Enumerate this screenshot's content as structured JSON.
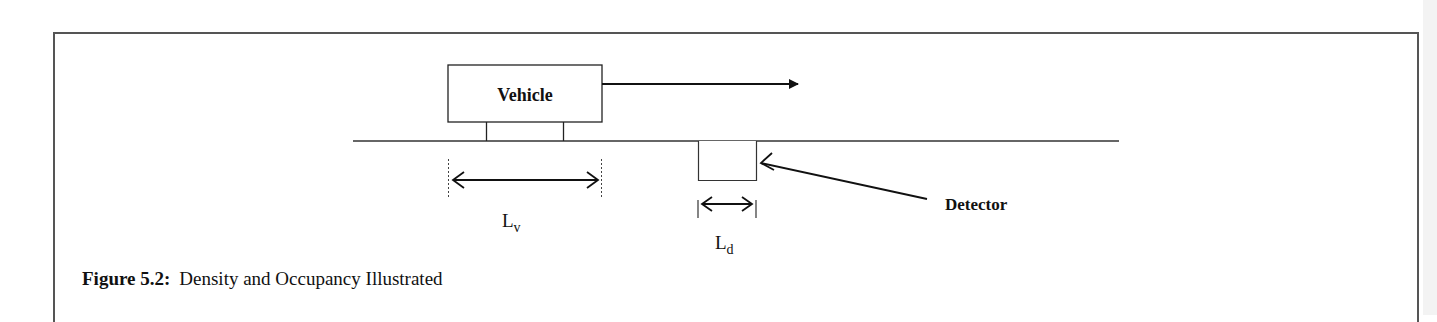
{
  "figure": {
    "caption_label": "Figure 5.2:",
    "caption_text": "Density and Occupancy Illustrated"
  },
  "diagram": {
    "vehicle_label": "Vehicle",
    "detector_label": "Detector",
    "vehicle_length_label": "L",
    "vehicle_length_subscript": "v",
    "detector_length_label": "L",
    "detector_length_subscript": "d"
  }
}
